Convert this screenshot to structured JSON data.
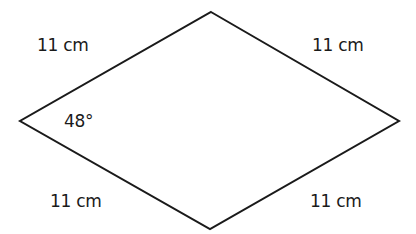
{
  "diagram": {
    "shape": "rhombus",
    "vertices": {
      "top": [
        211,
        12
      ],
      "right": [
        399,
        121
      ],
      "bottom": [
        210,
        229
      ],
      "left": [
        20,
        121
      ]
    },
    "stroke_color": "#1a1a1a",
    "side_labels": {
      "top_left": "11 cm",
      "top_right": "11 cm",
      "bottom_left": "11 cm",
      "bottom_right": "11 cm"
    },
    "angle_label": "48°"
  }
}
